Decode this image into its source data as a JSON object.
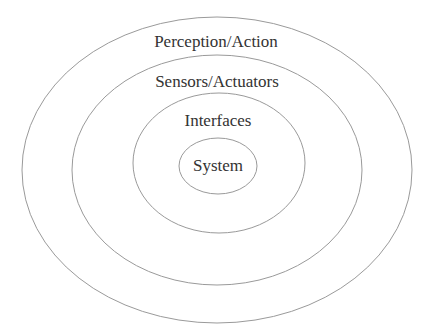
{
  "diagram": {
    "type": "concentric-ellipses",
    "stroke_color": "#9a9a9a",
    "text_color": "#333333",
    "background": "#ffffff",
    "layers": [
      {
        "label": "Perception/Action",
        "cx": 217,
        "cy": 170,
        "rx": 195,
        "ry": 153,
        "label_x": 216,
        "label_y": 47
      },
      {
        "label": "Sensors/Actuators",
        "cx": 217,
        "cy": 170,
        "rx": 145,
        "ry": 115,
        "label_x": 217,
        "label_y": 87
      },
      {
        "label": "Interfaces",
        "cx": 219,
        "cy": 163,
        "rx": 86,
        "ry": 70,
        "label_x": 218,
        "label_y": 126
      },
      {
        "label": "System",
        "cx": 218,
        "cy": 166,
        "rx": 39,
        "ry": 28,
        "label_x": 218,
        "label_y": 171
      }
    ]
  }
}
